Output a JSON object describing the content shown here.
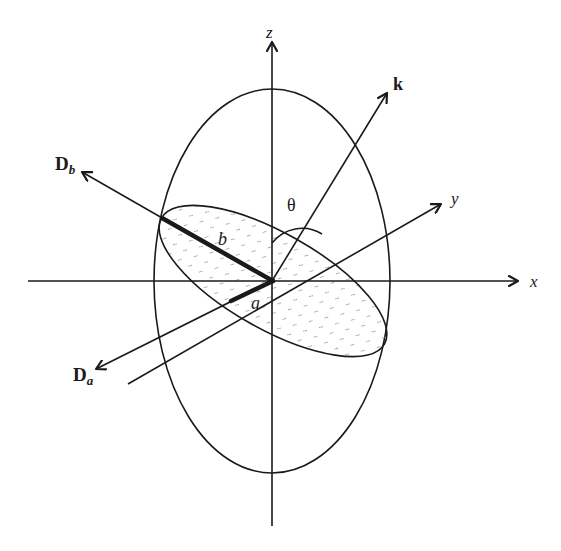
{
  "figure": {
    "axes": {
      "x": {
        "label": "x"
      },
      "y": {
        "label": "y"
      },
      "z": {
        "label": "z"
      }
    },
    "vectors": {
      "k": {
        "label": "k"
      },
      "Da": {
        "label_main": "D",
        "label_sub": "a"
      },
      "Db": {
        "label_main": "D",
        "label_sub": "b"
      }
    },
    "semi_axes": {
      "a": {
        "label": "a"
      },
      "b": {
        "label": "b"
      }
    },
    "angle": {
      "label": "θ"
    },
    "colors": {
      "stroke": "#1a1a1a",
      "background": "#ffffff",
      "hatch": "#9a9a9a"
    }
  }
}
